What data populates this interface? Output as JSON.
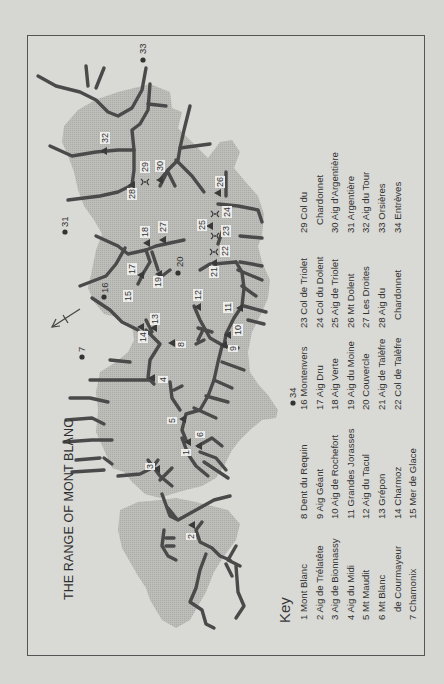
{
  "title": "THE RANGE OF MONT BLANC",
  "key": {
    "heading": "Key",
    "columns": [
      [
        "1 Mont Blanc",
        "2 Aig de Trélatête",
        "3 Aig de Bionnassy",
        "4 Aig du Midi",
        "5 Mt  Maudit",
        "6 Mt  Blanc",
        "   de Courmayeur",
        "7 Chamonix"
      ],
      [
        "8 Dent du Requin",
        "9 Aig Géant",
        "10 Aig de Rochefort",
        "11 Grandes Jorasses",
        "12 Aig du Tacul",
        "13 Grépon",
        "14 Charmoz",
        "15 Mer de Glace"
      ],
      [
        "16  Montenvers",
        "17 Aig  Dru",
        "18 Aig Verte",
        "19 Aig du Moine",
        "20 Couvercle",
        "21 Aig de Talèfre",
        "22 Col de Talèfre"
      ],
      [
        "23 Col de Triolet",
        "24 Col du Dolent",
        "25 Aig de Triolet",
        "26 Mt  Dolent",
        "27 Les Droites",
        "28 Aig du",
        "   Chardonnet"
      ],
      [
        "29 Col du",
        "   Chardonnet",
        "30 Aig d'Argentière",
        "31 Argentière",
        "32 Aig du Tour",
        "33 Orsières",
        "34 Entrèves"
      ]
    ]
  },
  "markers": [
    {
      "n": "1",
      "type": "peak",
      "x": 188,
      "y": 442,
      "lx": 181,
      "ly": 456
    },
    {
      "n": "2",
      "type": "peak",
      "x": 192,
      "y": 525,
      "lx": 186,
      "ly": 540
    },
    {
      "n": "3",
      "type": "peak",
      "x": 157,
      "y": 469,
      "lx": 145,
      "ly": 470
    },
    {
      "n": "4",
      "type": "peak",
      "x": 152,
      "y": 378,
      "lx": 158,
      "ly": 383
    },
    {
      "n": "5",
      "type": "peak",
      "x": 183,
      "y": 419,
      "lx": 167,
      "ly": 424
    },
    {
      "n": "6",
      "type": "peak",
      "x": 199,
      "y": 446,
      "lx": 195,
      "ly": 438
    },
    {
      "n": "7",
      "type": "town",
      "x": 82,
      "y": 357,
      "lx": 77,
      "ly": 352
    },
    {
      "n": "8",
      "type": "peak",
      "x": 172,
      "y": 343,
      "lx": 176,
      "ly": 348
    },
    {
      "n": "9",
      "type": "peak",
      "x": 224,
      "y": 345,
      "lx": 228,
      "ly": 352
    },
    {
      "n": "10",
      "type": "peak",
      "x": 228,
      "y": 335,
      "lx": 233,
      "ly": 336
    },
    {
      "n": "11",
      "type": "peak",
      "x": 240,
      "y": 308,
      "lx": 223,
      "ly": 313
    },
    {
      "n": "12",
      "type": "peak",
      "x": 198,
      "y": 307,
      "lx": 193,
      "ly": 301
    },
    {
      "n": "13",
      "type": "peak",
      "x": 154,
      "y": 328,
      "lx": 150,
      "ly": 325
    },
    {
      "n": "14",
      "type": "peak",
      "x": 141,
      "y": 327,
      "lx": 138,
      "ly": 343
    },
    {
      "n": "15",
      "type": "glacier",
      "x": 128,
      "y": 297,
      "lx": 123,
      "ly": 302
    },
    {
      "n": "16",
      "type": "town",
      "x": 104,
      "y": 297,
      "lx": 100,
      "ly": 293
    },
    {
      "n": "17",
      "type": "peak",
      "x": 141,
      "y": 275,
      "lx": 127,
      "ly": 275
    },
    {
      "n": "18",
      "type": "peak",
      "x": 147,
      "y": 243,
      "lx": 140,
      "ly": 238
    },
    {
      "n": "19",
      "type": "peak",
      "x": 159,
      "y": 274,
      "lx": 153,
      "ly": 288
    },
    {
      "n": "20",
      "type": "town",
      "x": 178,
      "y": 273,
      "lx": 175,
      "ly": 267
    },
    {
      "n": "21",
      "type": "peak",
      "x": 214,
      "y": 263,
      "lx": 209,
      "ly": 278
    },
    {
      "n": "22",
      "type": "pass",
      "x": 214,
      "y": 252,
      "lx": 220,
      "ly": 257
    },
    {
      "n": "23",
      "type": "pass",
      "x": 215,
      "y": 236,
      "lx": 221,
      "ly": 237
    },
    {
      "n": "24",
      "type": "pass",
      "x": 215,
      "y": 214,
      "lx": 222,
      "ly": 218
    },
    {
      "n": "25",
      "type": "peak",
      "x": 210,
      "y": 226,
      "lx": 197,
      "ly": 231
    },
    {
      "n": "26",
      "type": "peak",
      "x": 218,
      "y": 193,
      "lx": 215,
      "ly": 188
    },
    {
      "n": "27",
      "type": "peak",
      "x": 163,
      "y": 240,
      "lx": 158,
      "ly": 233
    },
    {
      "n": "28",
      "type": "peak",
      "x": 132,
      "y": 185,
      "lx": 127,
      "ly": 200
    },
    {
      "n": "29",
      "type": "pass",
      "x": 145,
      "y": 182,
      "lx": 140,
      "ly": 173
    },
    {
      "n": "30",
      "type": "peak",
      "x": 160,
      "y": 180,
      "lx": 155,
      "ly": 172
    },
    {
      "n": "31",
      "type": "town",
      "x": 65,
      "y": 232,
      "lx": 60,
      "ly": 227
    },
    {
      "n": "32",
      "type": "peak",
      "x": 104,
      "y": 151,
      "lx": 100,
      "ly": 144
    },
    {
      "n": "33",
      "type": "town",
      "x": 143,
      "y": 60,
      "lx": 138,
      "ly": 54
    },
    {
      "n": "34",
      "type": "town",
      "x": 293,
      "y": 403,
      "lx": 288,
      "ly": 398
    }
  ],
  "colors": {
    "paper": "#d7d7d3",
    "range_fill": "#b4b4b1",
    "ridge": "#4a4a4a",
    "frame": "#555555",
    "text": "#333333"
  }
}
